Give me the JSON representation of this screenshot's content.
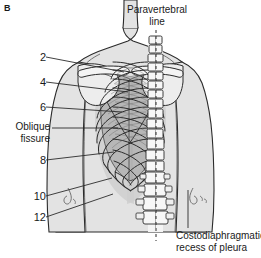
{
  "figure": {
    "panel_letter": "B",
    "background_color": "#ffffff",
    "ink_color": "#1a1a1a",
    "body_fill": "#e3e3e3",
    "skeleton_fill": "#f2f2f2",
    "lung_fill": "#b9b9b9",
    "pleura_fill": "#cfcfcf"
  },
  "titles": {
    "paravertebral_line_1": "Paravertebral",
    "paravertebral_line_2": "line"
  },
  "caption": {
    "costodiaphragmatic_1": "Costodiaphragmatic",
    "costodiaphragmatic_2": "recess of pleura"
  },
  "left_labels": [
    {
      "name": "rib-2",
      "text": "2",
      "x": 30,
      "y": 52
    },
    {
      "name": "rib-4",
      "text": "4",
      "x": 30,
      "y": 77
    },
    {
      "name": "rib-6",
      "text": "6",
      "x": 30,
      "y": 102
    },
    {
      "name": "oblique-fissure-1",
      "text": "Oblique",
      "x": 4,
      "y": 122
    },
    {
      "name": "oblique-fissure-2",
      "text": "fissure",
      "x": 4,
      "y": 134
    },
    {
      "name": "rib-8",
      "text": "8",
      "x": 30,
      "y": 155
    },
    {
      "name": "rib-10",
      "text": "10",
      "x": 22,
      "y": 191
    },
    {
      "name": "rib-12",
      "text": "12",
      "x": 22,
      "y": 212
    }
  ],
  "leaders": [
    {
      "name": "leader-rib-2",
      "x1": 46,
      "y1": 57,
      "x2": 124,
      "y2": 72
    },
    {
      "name": "leader-rib-4",
      "x1": 46,
      "y1": 82,
      "x2": 128,
      "y2": 92
    },
    {
      "name": "leader-rib-6",
      "x1": 46,
      "y1": 107,
      "x2": 122,
      "y2": 112
    },
    {
      "name": "leader-oblique",
      "x1": 52,
      "y1": 128,
      "x2": 118,
      "y2": 128
    },
    {
      "name": "leader-rib-8",
      "x1": 46,
      "y1": 160,
      "x2": 114,
      "y2": 152
    },
    {
      "name": "leader-rib-10",
      "x1": 46,
      "y1": 196,
      "x2": 112,
      "y2": 178
    },
    {
      "name": "leader-rib-12",
      "x1": 46,
      "y1": 217,
      "x2": 113,
      "y2": 194
    },
    {
      "name": "leader-costodiaphragmatic",
      "x1": 188,
      "y1": 190,
      "x2": 188,
      "y2": 228
    }
  ],
  "paravertebral": {
    "name": "paravertebral-dashed-line",
    "x": 156,
    "y_top": 30,
    "y_bottom": 241,
    "dash": "3 3"
  }
}
